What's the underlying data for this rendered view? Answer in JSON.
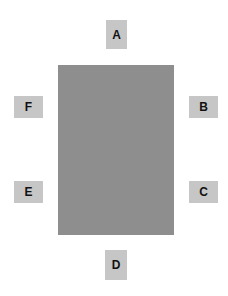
{
  "diagram": {
    "center_block": {
      "color": "#8e8e8e"
    },
    "label_color": "#c6c6c6",
    "labels": {
      "top": "A",
      "right_upper": "B",
      "right_lower": "C",
      "bottom": "D",
      "left_lower": "E",
      "left_upper": "F"
    }
  }
}
